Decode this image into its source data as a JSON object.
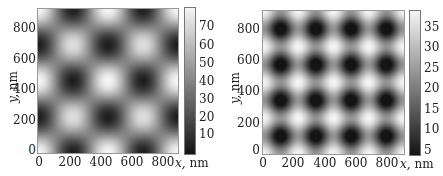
{
  "chart_data": [
    {
      "type": "heatmap",
      "title": "",
      "xlabel": "x, nm",
      "ylabel": "y, nm",
      "xlim": [
        0,
        920
      ],
      "ylim": [
        0,
        920
      ],
      "xticks": [
        "0",
        "200",
        "400",
        "600",
        "800"
      ],
      "yticks": [
        "0",
        "200",
        "400",
        "600",
        "800"
      ],
      "colorbar": {
        "ticks": [
          "10",
          "20",
          "30",
          "40",
          "50",
          "60",
          "70"
        ],
        "range": [
          1,
          77
        ],
        "colormap": "gray"
      },
      "pattern": "square lattice of bright maxima, period ~460 nm, diagonal (checkerboard) arrangement",
      "maxima_nm": [
        [
          0,
          0
        ],
        [
          460,
          0
        ],
        [
          920,
          0
        ],
        [
          230,
          230
        ],
        [
          690,
          230
        ],
        [
          0,
          460
        ],
        [
          460,
          460
        ],
        [
          920,
          460
        ],
        [
          230,
          690
        ],
        [
          690,
          690
        ],
        [
          0,
          920
        ],
        [
          460,
          920
        ],
        [
          920,
          920
        ]
      ],
      "minima_nm": [
        [
          230,
          0
        ],
        [
          690,
          0
        ],
        [
          0,
          230
        ],
        [
          460,
          230
        ],
        [
          920,
          230
        ],
        [
          230,
          460
        ],
        [
          690,
          460
        ],
        [
          0,
          690
        ],
        [
          460,
          690
        ],
        [
          920,
          690
        ],
        [
          230,
          920
        ],
        [
          690,
          920
        ]
      ],
      "value_range": [
        1,
        77
      ]
    },
    {
      "type": "heatmap",
      "title": "",
      "xlabel": "x, nm",
      "ylabel": "y, nm",
      "xlim": [
        0,
        920
      ],
      "ylim": [
        0,
        920
      ],
      "xticks": [
        "0",
        "200",
        "400",
        "600",
        "800"
      ],
      "yticks": [
        "0",
        "200",
        "400",
        "600",
        "800"
      ],
      "colorbar": {
        "ticks": [
          "5",
          "10",
          "15",
          "20",
          "25",
          "30",
          "35"
        ],
        "range": [
          3,
          38
        ],
        "colormap": "gray"
      },
      "pattern": "square lattice of dark minima, period ~230 nm, 4x4 visible",
      "minima_nm_x": [
        115,
        345,
        575,
        805
      ],
      "minima_nm_y": [
        115,
        345,
        575,
        805
      ],
      "value_range": [
        3,
        38
      ]
    }
  ],
  "panels": [
    {
      "xticks": [
        "0",
        "200",
        "400",
        "600",
        "800"
      ],
      "yticks": [
        "0",
        "200",
        "400",
        "600",
        "800"
      ],
      "xlabel_var": "x,",
      "xlabel_unit": " nm",
      "ylabel_var": "y,",
      "ylabel_unit": " nm",
      "cticks": [
        "10",
        "20",
        "30",
        "40",
        "50",
        "60",
        "70"
      ]
    },
    {
      "xticks": [
        "0",
        "200",
        "400",
        "600",
        "800"
      ],
      "yticks": [
        "0",
        "200",
        "400",
        "600",
        "800"
      ],
      "xlabel_var": "x,",
      "xlabel_unit": " nm",
      "ylabel_var": "y,",
      "ylabel_unit": " nm",
      "cticks": [
        "5",
        "10",
        "15",
        "20",
        "25",
        "30",
        "35"
      ]
    }
  ]
}
